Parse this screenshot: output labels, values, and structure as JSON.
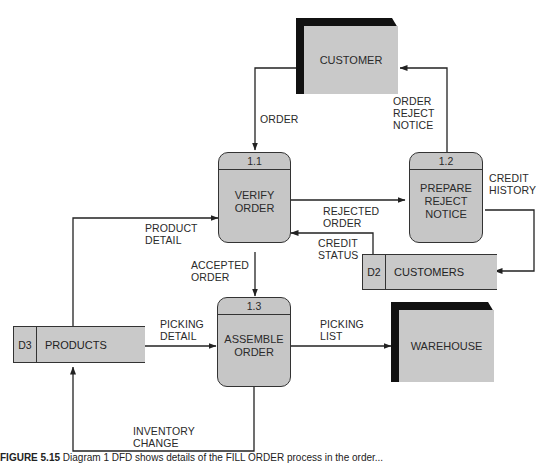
{
  "diagram": {
    "type": "data-flow-diagram",
    "external_entities": [
      {
        "id": "customer",
        "label": "CUSTOMER"
      },
      {
        "id": "warehouse",
        "label": "WAREHOUSE"
      }
    ],
    "processes": [
      {
        "id": "1.1",
        "name_line1": "VERIFY",
        "name_line2": "ORDER",
        "name_line3": ""
      },
      {
        "id": "1.2",
        "name_line1": "PREPARE",
        "name_line2": "REJECT",
        "name_line3": "NOTICE"
      },
      {
        "id": "1.3",
        "name_line1": "ASSEMBLE",
        "name_line2": "ORDER",
        "name_line3": ""
      }
    ],
    "data_stores": [
      {
        "id": "D2",
        "label": "CUSTOMERS"
      },
      {
        "id": "D3",
        "label": "PRODUCTS"
      }
    ],
    "flows": [
      {
        "label_line1": "ORDER",
        "label_line2": "",
        "label_line3": "",
        "from": "CUSTOMER",
        "to": "1.1"
      },
      {
        "label_line1": "ORDER",
        "label_line2": "REJECT",
        "label_line3": "NOTICE",
        "from": "1.2",
        "to": "CUSTOMER"
      },
      {
        "label_line1": "REJECTED",
        "label_line2": "ORDER",
        "label_line3": "",
        "from": "1.1",
        "to": "1.2"
      },
      {
        "label_line1": "CREDIT",
        "label_line2": "HISTORY",
        "label_line3": "",
        "from": "1.2",
        "to": "D2"
      },
      {
        "label_line1": "CREDIT",
        "label_line2": "STATUS",
        "label_line3": "",
        "from": "D2",
        "to": "1.1"
      },
      {
        "label_line1": "PRODUCT",
        "label_line2": "DETAIL",
        "label_line3": "",
        "from": "D3",
        "to": "1.1"
      },
      {
        "label_line1": "ACCEPTED",
        "label_line2": "ORDER",
        "label_line3": "",
        "from": "1.1",
        "to": "1.3"
      },
      {
        "label_line1": "PICKING",
        "label_line2": "DETAIL",
        "label_line3": "",
        "from": "D3",
        "to": "1.3"
      },
      {
        "label_line1": "PICKING",
        "label_line2": "LIST",
        "label_line3": "",
        "from": "1.3",
        "to": "WAREHOUSE"
      },
      {
        "label_line1": "INVENTORY",
        "label_line2": "CHANGE",
        "label_line3": "",
        "from": "1.3",
        "to": "D3"
      }
    ]
  },
  "caption": {
    "figure_number": "FIGURE 5.15",
    "text": "Diagram 1 DFD shows details of the FILL ORDER process in the order..."
  },
  "colors": {
    "shape_fill": "#c8c8c8",
    "entity_shadow": "#111111",
    "line": "#222222"
  }
}
